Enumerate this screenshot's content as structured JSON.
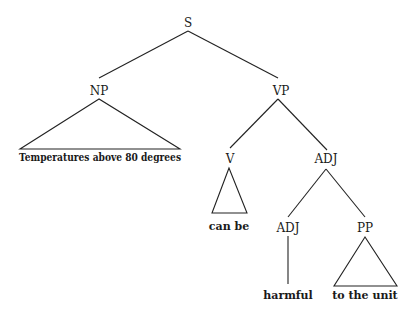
{
  "diagram": {
    "type": "parse-tree",
    "nodes": {
      "s": "S",
      "np": "NP",
      "vp": "VP",
      "v": "V",
      "adj_top": "ADJ",
      "adj_bottom": "ADJ",
      "pp": "PP"
    },
    "leaves": {
      "np_text": "Temperatures above 80 degrees",
      "v_text": "can be",
      "adj_text": "harmful",
      "pp_text": "to the unit"
    },
    "structure": [
      {
        "parent": "S",
        "children": [
          "NP",
          "VP"
        ]
      },
      {
        "parent": "NP",
        "children": [
          "Temperatures above 80 degrees"
        ],
        "style": "triangle"
      },
      {
        "parent": "VP",
        "children": [
          "V",
          "ADJ"
        ]
      },
      {
        "parent": "V",
        "children": [
          "can be"
        ],
        "style": "triangle"
      },
      {
        "parent": "ADJ",
        "children": [
          "ADJ",
          "PP"
        ]
      },
      {
        "parent": "ADJ",
        "children": [
          "harmful"
        ],
        "style": "line"
      },
      {
        "parent": "PP",
        "children": [
          "to the unit"
        ],
        "style": "triangle"
      }
    ]
  }
}
